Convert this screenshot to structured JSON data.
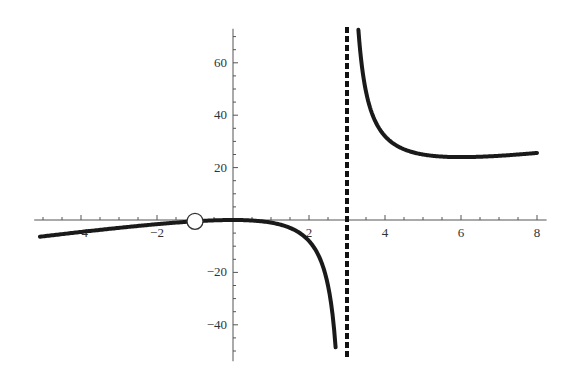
{
  "chart_data": {
    "type": "line",
    "title": "",
    "xlabel": "",
    "ylabel": "",
    "function": "f(x) = 2x^2/(x-3), with removable discontinuity at x = -1",
    "xlim": [
      -5.1,
      8.2
    ],
    "ylim": [
      -52,
      73
    ],
    "grid": false,
    "legend": null,
    "x_ticks": [
      -4,
      -2,
      2,
      4,
      6,
      8
    ],
    "x_tick_labels": [
      "-4",
      "-2",
      "2",
      "4",
      "6",
      "8"
    ],
    "x_minor_step": 0.5,
    "y_ticks": [
      -40,
      -20,
      20,
      40,
      60
    ],
    "y_tick_labels": [
      "-40",
      "-20",
      "20",
      "40",
      "60"
    ],
    "y_minor_step": 5,
    "vertical_asymptote": {
      "x": 3,
      "style": "dashed"
    },
    "hole": {
      "x": -1,
      "y": -0.5,
      "style": "open-circle"
    },
    "series": [
      {
        "name": "left-branch",
        "x_range": [
          -5.08,
          2.7
        ],
        "points": [
          [
            -5,
            -6.25
          ],
          [
            -4,
            -4.57
          ],
          [
            -3,
            -3.0
          ],
          [
            -2,
            -1.6
          ],
          [
            -1,
            -0.5
          ],
          [
            0,
            0
          ],
          [
            1,
            -1
          ],
          [
            2,
            -8
          ],
          [
            2.5,
            -25
          ],
          [
            2.7,
            -48.6
          ]
        ]
      },
      {
        "name": "right-branch",
        "x_range": [
          3.3,
          8
        ],
        "points": [
          [
            3.3,
            72.6
          ],
          [
            3.5,
            49
          ],
          [
            4,
            32
          ],
          [
            5,
            25
          ],
          [
            6,
            24
          ],
          [
            7,
            24.5
          ],
          [
            8,
            25.6
          ]
        ]
      }
    ],
    "colors": {
      "curve": "#1a1a1a",
      "axis": "#555555",
      "asymptote": "#111111"
    }
  }
}
